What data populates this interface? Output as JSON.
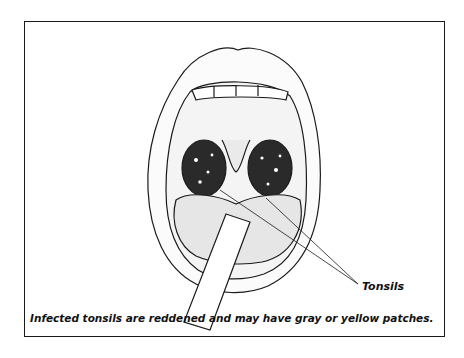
{
  "figure": {
    "labels": [
      {
        "text": "Tonsils",
        "points_to": [
          "left-tonsil",
          "right-tonsil"
        ]
      }
    ],
    "caption": "Infected tonsils are reddened and may have gray or yellow patches.",
    "parts": [
      "upper-lip",
      "upper-teeth",
      "palate",
      "uvula",
      "left-tonsil",
      "right-tonsil",
      "tongue",
      "tongue-depressor",
      "lower-lip"
    ],
    "colors": {
      "ink": "#1a1a1a",
      "tonsil": "#2a2a2a",
      "background": "#ffffff"
    }
  }
}
